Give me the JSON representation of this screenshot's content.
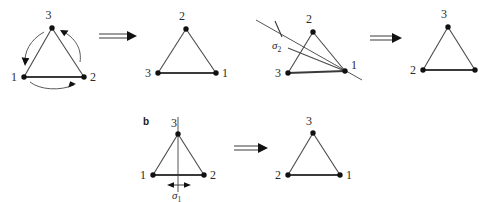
{
  "figure": {
    "title_visible": false,
    "panels": [
      {
        "id": "a",
        "label": "",
        "operation": "C3-rotation",
        "steps": [
          {
            "name": "initial-triangle",
            "vertices": [
              {
                "label": "3",
                "pos": "top"
              },
              {
                "label": "1",
                "pos": "bottom-left"
              },
              {
                "label": "2",
                "pos": "bottom-right"
              }
            ],
            "arrows": [
              {
                "name": "arc-3-to-1",
                "direction": "counterclockwise-down-left"
              },
              {
                "name": "arc-1-to-2",
                "direction": "left-to-right"
              },
              {
                "name": "arc-2-to-3",
                "direction": "up-left"
              }
            ]
          },
          {
            "name": "rotated-triangle",
            "vertices": [
              {
                "label": "2",
                "pos": "top"
              },
              {
                "label": "3",
                "pos": "bottom-left"
              },
              {
                "label": "1",
                "pos": "bottom-right"
              }
            ]
          },
          {
            "name": "mirror-triangle",
            "mirror_label": "σ",
            "mirror_subscript": "2",
            "vertices": [
              {
                "label": "2",
                "pos": "top"
              },
              {
                "label": "3",
                "pos": "bottom-left"
              },
              {
                "label": "1",
                "pos": "bottom-right"
              }
            ]
          },
          {
            "name": "reflected-triangle",
            "vertices": [
              {
                "label": "3",
                "pos": "top"
              },
              {
                "label": "2",
                "pos": "bottom-left"
              },
              {
                "label": "",
                "pos": "bottom-right"
              }
            ]
          }
        ],
        "implies_symbols": [
          "⟹",
          "⟹"
        ]
      },
      {
        "id": "b",
        "label": "b",
        "operation": "sigma1-reflection",
        "steps": [
          {
            "name": "initial-triangle",
            "mirror_label": "σ",
            "mirror_subscript": "1",
            "vertices": [
              {
                "label": "3",
                "pos": "top"
              },
              {
                "label": "1",
                "pos": "bottom-left"
              },
              {
                "label": "2",
                "pos": "bottom-right"
              }
            ]
          },
          {
            "name": "reflected-triangle",
            "vertices": [
              {
                "label": "3",
                "pos": "top"
              },
              {
                "label": "2",
                "pos": "bottom-left"
              },
              {
                "label": "1",
                "pos": "bottom-right"
              }
            ]
          }
        ],
        "implies_symbols": [
          "⟹"
        ]
      }
    ],
    "colors": {
      "vertex": "#111111",
      "edge": "#4a4a4a",
      "mirror": "#555555",
      "text": "#2b2b2b",
      "background": "#ffffff"
    }
  }
}
